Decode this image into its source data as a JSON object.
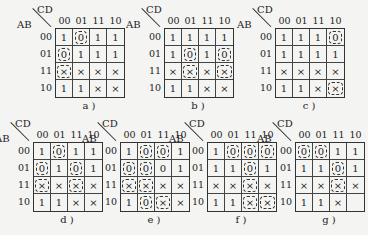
{
  "row_label": "AB",
  "col_label": "CD",
  "col_headers": [
    "00",
    "01",
    "11",
    "10"
  ],
  "row_headers": [
    "00",
    "01",
    "11",
    "10"
  ],
  "maps": [
    {
      "id": "a",
      "caption": "a )",
      "x": 55,
      "y": 28,
      "cells": [
        [
          "1",
          "0",
          "1",
          "1"
        ],
        [
          "0",
          "1",
          "1",
          "1"
        ],
        [
          "×",
          "×",
          "×",
          "×"
        ],
        [
          "1",
          "1",
          "×",
          "×"
        ]
      ],
      "circled": [
        [
          0,
          1
        ],
        [
          1,
          0
        ],
        [
          2,
          0
        ]
      ]
    },
    {
      "id": "b",
      "caption": "b )",
      "x": 164,
      "y": 28,
      "cells": [
        [
          "1",
          "1",
          "1",
          "1"
        ],
        [
          "1",
          "0",
          "1",
          "0"
        ],
        [
          "×",
          "×",
          "×",
          "×"
        ],
        [
          "1",
          "1",
          "×",
          "×"
        ]
      ],
      "circled": [
        [
          1,
          1
        ],
        [
          2,
          1
        ],
        [
          1,
          3
        ],
        [
          2,
          3
        ]
      ]
    },
    {
      "id": "c",
      "caption": "c )",
      "x": 275,
      "y": 28,
      "cells": [
        [
          "1",
          "1",
          "1",
          "0"
        ],
        [
          "1",
          "1",
          "1",
          "1"
        ],
        [
          "×",
          "×",
          "×",
          "×"
        ],
        [
          "1",
          "1",
          "×",
          "×"
        ]
      ],
      "circled": [
        [
          0,
          3
        ],
        [
          3,
          3
        ]
      ]
    },
    {
      "id": "d",
      "caption": "d )",
      "x": 33,
      "y": 142,
      "cells": [
        [
          "1",
          "0",
          "1",
          "1"
        ],
        [
          "0",
          "1",
          "0",
          "1"
        ],
        [
          "×",
          "×",
          "×",
          "×"
        ],
        [
          "1",
          "1",
          "×",
          "×"
        ]
      ],
      "circled": [
        [
          0,
          1
        ],
        [
          1,
          0
        ],
        [
          2,
          0
        ],
        [
          1,
          2
        ],
        [
          2,
          2
        ]
      ]
    },
    {
      "id": "e",
      "caption": "e )",
      "x": 120,
      "y": 142,
      "cells": [
        [
          "1",
          "0",
          "0",
          "1"
        ],
        [
          "0",
          "0",
          "0",
          "1"
        ],
        [
          "×",
          "×",
          "×",
          "×"
        ],
        [
          "1",
          "0",
          "×",
          "×"
        ]
      ],
      "circled": [
        [
          0,
          1
        ],
        [
          0,
          2
        ],
        [
          1,
          0
        ],
        [
          1,
          1
        ],
        [
          2,
          0
        ],
        [
          2,
          1
        ],
        [
          3,
          1
        ],
        [
          3,
          2
        ]
      ]
    },
    {
      "id": "f",
      "caption": "f )",
      "x": 207,
      "y": 142,
      "cells": [
        [
          "1",
          "0",
          "0",
          "0"
        ],
        [
          "1",
          "1",
          "0",
          "1"
        ],
        [
          "×",
          "×",
          "×",
          "×"
        ],
        [
          "1",
          "1",
          "×",
          "×"
        ]
      ],
      "circled": [
        [
          0,
          1
        ],
        [
          0,
          2
        ],
        [
          0,
          3
        ],
        [
          1,
          2
        ],
        [
          2,
          2
        ],
        [
          3,
          2
        ],
        [
          3,
          3
        ]
      ]
    },
    {
      "id": "g",
      "caption": "g )",
      "x": 295,
      "y": 142,
      "cells": [
        [
          "0",
          "0",
          "1",
          "1"
        ],
        [
          "1",
          "1",
          "0",
          "1"
        ],
        [
          "×",
          "×",
          "×",
          "×"
        ],
        [
          "1",
          "1",
          "×",
          ""
        ]
      ],
      "circled": [
        [
          0,
          0
        ],
        [
          0,
          1
        ],
        [
          1,
          2
        ],
        [
          2,
          2
        ]
      ]
    }
  ]
}
